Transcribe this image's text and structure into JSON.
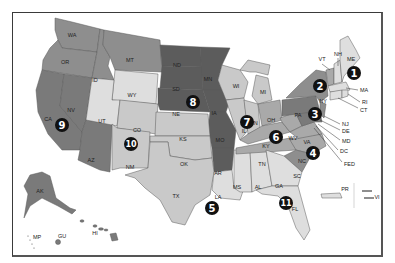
{
  "map": {
    "colors": {
      "dark": "#5c5c5c",
      "medium_dark": "#7a7a7a",
      "medium": "#8e8e8e",
      "light_medium": "#a9a9a9",
      "light": "#c9c9c9",
      "lightest": "#dedede",
      "frame": "#3a3a3a",
      "badge": "#111111"
    },
    "regions": [
      {
        "number": "1",
        "states": [
          "ME",
          "NH",
          "VT",
          "MA",
          "RI",
          "CT"
        ]
      },
      {
        "number": "2",
        "states": [
          "NY",
          "NJ",
          "PR",
          "VI"
        ]
      },
      {
        "number": "3",
        "states": [
          "PA",
          "DE",
          "MD",
          "DC",
          "VA",
          "WV"
        ]
      },
      {
        "number": "4",
        "states": [
          "NC",
          "SC",
          "KY",
          "TN",
          "FED"
        ]
      },
      {
        "number": "5",
        "states": [
          "LA",
          "MS",
          "AL"
        ]
      },
      {
        "number": "6",
        "states": [
          "OH",
          "WV",
          "KY"
        ]
      },
      {
        "number": "7",
        "states": [
          "IL",
          "IN",
          "WI",
          "MI"
        ]
      },
      {
        "number": "8",
        "states": [
          "ND",
          "SD",
          "NE",
          "MN",
          "IA",
          "MO",
          "AR"
        ]
      },
      {
        "number": "9",
        "states": [
          "CA",
          "NV",
          "AZ",
          "HI",
          "GU",
          "MP"
        ]
      },
      {
        "number": "10",
        "states": [
          "CO",
          "UT",
          "WY",
          "NM",
          "KS",
          "OK",
          "TX"
        ]
      },
      {
        "number": "11",
        "states": [
          "GA",
          "FL",
          "AL"
        ]
      }
    ],
    "state_labels": {
      "WA": "WA",
      "OR": "OR",
      "ID": "ID",
      "MT": "MT",
      "WY": "WY",
      "CA": "CA",
      "NV": "NV",
      "UT": "UT",
      "AZ": "AZ",
      "CO": "CO",
      "NM": "NM",
      "ND": "ND",
      "SD": "SD",
      "NE": "NE",
      "KS": "KS",
      "OK": "OK",
      "TX": "TX",
      "MN": "MN",
      "IA": "IA",
      "MO": "MO",
      "AR": "AR",
      "LA": "LA",
      "WI": "WI",
      "MI": "MI",
      "IL": "IL",
      "IN": "IN",
      "OH": "OH",
      "KY": "KY",
      "TN": "TN",
      "MS": "MS",
      "AL": "AL",
      "GA": "GA",
      "FL": "FL",
      "SC": "SC",
      "NC": "NC",
      "VA": "VA",
      "WV": "WV",
      "PA": "PA",
      "NY": "NY",
      "VT": "VT",
      "NH": "NH",
      "ME": "ME",
      "MA": "MA",
      "RI": "RI",
      "CT": "CT",
      "NJ": "NJ",
      "DE": "DE",
      "MD": "MD",
      "DC": "DC",
      "FED": "FED",
      "AK": "AK",
      "HI": "HI",
      "GU": "GU",
      "MP": "MP",
      "PR": "PR",
      "VI": "VI"
    },
    "badges": [
      {
        "id": "1",
        "label": "1"
      },
      {
        "id": "2",
        "label": "2"
      },
      {
        "id": "3",
        "label": "3"
      },
      {
        "id": "4",
        "label": "4"
      },
      {
        "id": "5",
        "label": "5"
      },
      {
        "id": "6",
        "label": "6"
      },
      {
        "id": "7",
        "label": "7"
      },
      {
        "id": "8",
        "label": "8"
      },
      {
        "id": "9",
        "label": "9"
      },
      {
        "id": "10",
        "label": "10"
      },
      {
        "id": "11",
        "label": "11"
      }
    ]
  }
}
